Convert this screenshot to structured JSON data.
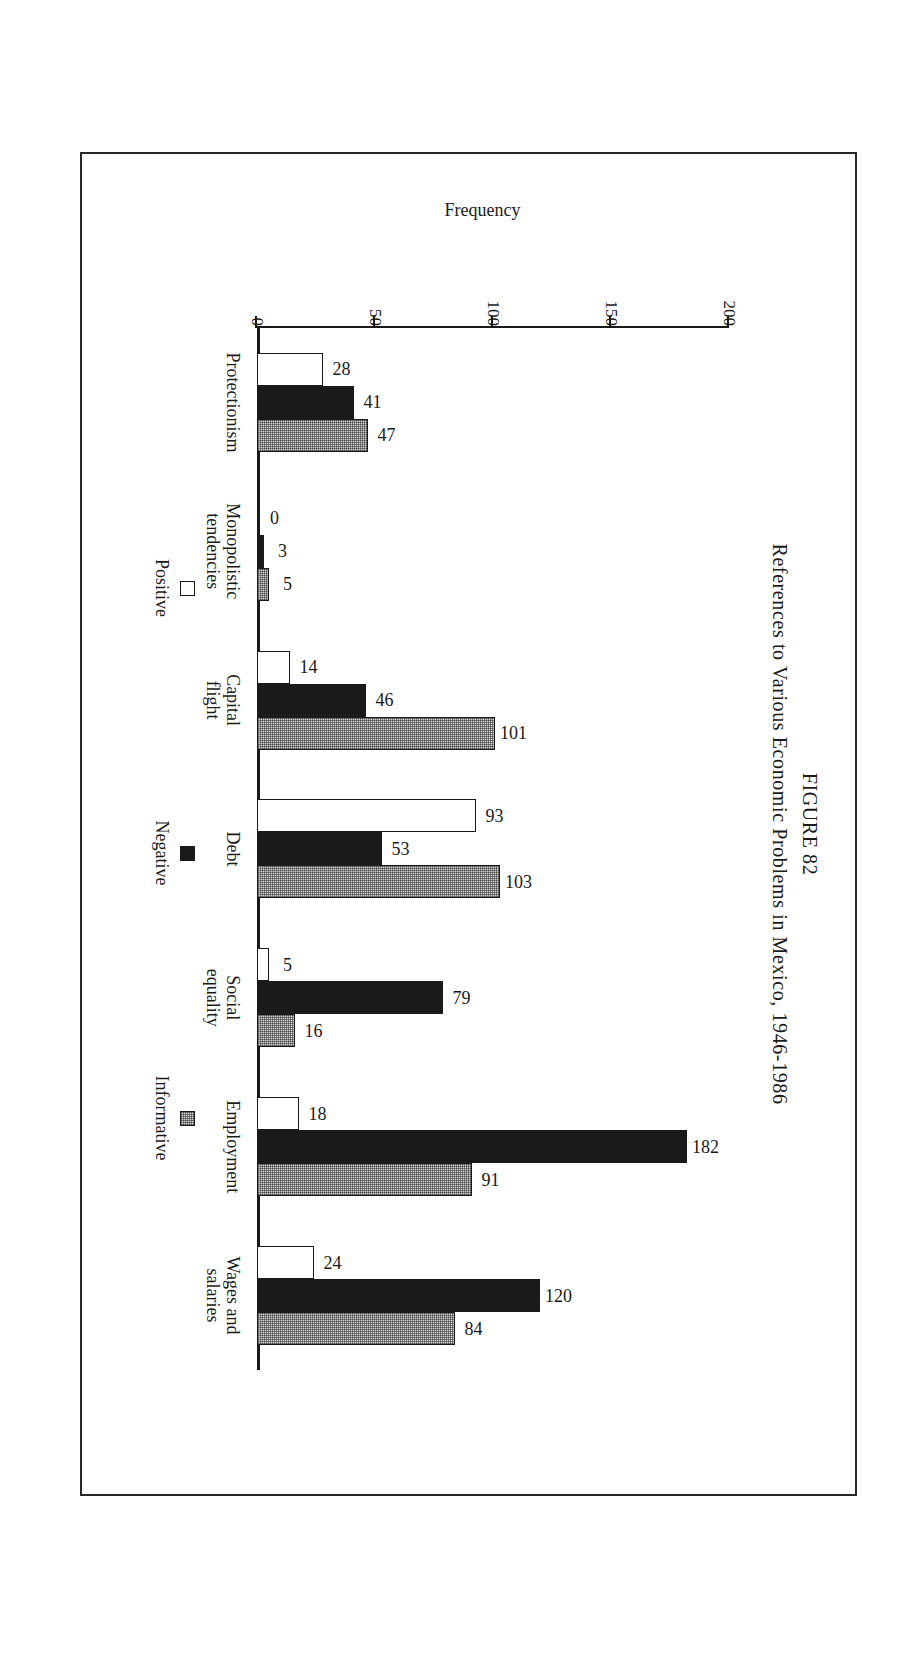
{
  "figure": {
    "number_label": "FIGURE 82",
    "caption": "References to Various Economic Problems in Mexico, 1946-1986"
  },
  "chart_data": {
    "type": "bar",
    "title": "References to Various Economic Problems in Mexico, 1946-1986",
    "subtitle": "FIGURE 82",
    "orientation": "vertical-grouped",
    "xlabel": "",
    "ylabel": "Frequency",
    "ylim": [
      0,
      200
    ],
    "yticks": [
      0,
      50,
      100,
      150,
      200
    ],
    "ytick_labels": [
      "0",
      "50",
      "100",
      "150",
      "200"
    ],
    "grid": false,
    "legend_position": "bottom",
    "categories": [
      "Protectionism",
      "Monopolistic tendencies",
      "Capital flight",
      "Debt",
      "Social equality",
      "Employment",
      "Wages and salaries"
    ],
    "category_lines": [
      [
        "Protectionism"
      ],
      [
        "Monopolistic",
        "tendencies"
      ],
      [
        "Capital",
        "flight"
      ],
      [
        "Debt"
      ],
      [
        "Social",
        "equality"
      ],
      [
        "Employment"
      ],
      [
        "Wages and",
        "salaries"
      ]
    ],
    "series": [
      {
        "name": "Positive",
        "color": "#ffffff",
        "values": [
          28,
          0,
          14,
          93,
          5,
          18,
          24
        ]
      },
      {
        "name": "Negative",
        "color": "#1a1a1a",
        "values": [
          41,
          3,
          46,
          53,
          79,
          182,
          120
        ]
      },
      {
        "name": "Informative",
        "color": "#d4d4d4",
        "values": [
          47,
          5,
          101,
          103,
          16,
          91,
          84
        ]
      }
    ]
  },
  "legend": {
    "items": [
      {
        "label": "Positive",
        "swatch": "positive"
      },
      {
        "label": "Negative",
        "swatch": "negative"
      },
      {
        "label": "Informative",
        "swatch": "informative"
      }
    ]
  },
  "colors": {
    "ink": "#1a1a1a",
    "page": "#ffffff",
    "informative_fill": "#d4d4d4",
    "frame": "#262626"
  }
}
